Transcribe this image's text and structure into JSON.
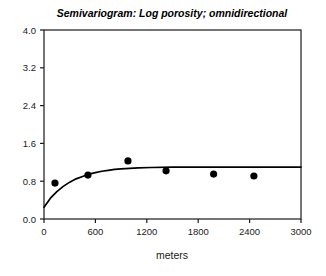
{
  "chart_data": {
    "type": "scatter",
    "title": "Semivariogram: Log porosity; omnidirectional",
    "xlabel": "meters",
    "ylabel": "",
    "xlim": [
      0,
      3000
    ],
    "ylim": [
      0.0,
      4.0
    ],
    "grid": false,
    "legend": "none",
    "xticks": [
      "0",
      "600",
      "1200",
      "1800",
      "2400",
      "3000"
    ],
    "xtick_values": [
      0,
      600,
      1200,
      1800,
      2400,
      3000
    ],
    "yticks": [
      "0.0",
      "0.8",
      "1.6",
      "2.4",
      "3.2",
      "4.0"
    ],
    "ytick_values": [
      0.0,
      0.8,
      1.6,
      2.4,
      3.2,
      4.0
    ],
    "series": [
      {
        "name": "experimental semivariogram",
        "kind": "scatter",
        "marker": "filled-circle",
        "color": "#000000",
        "points": [
          {
            "x": 128,
            "y": 0.76
          },
          {
            "x": 513,
            "y": 0.93
          },
          {
            "x": 980,
            "y": 1.23
          },
          {
            "x": 1425,
            "y": 1.02
          },
          {
            "x": 1980,
            "y": 0.95
          },
          {
            "x": 2450,
            "y": 0.91
          }
        ]
      },
      {
        "name": "fitted model",
        "kind": "line",
        "color": "#000000",
        "model": "exponential",
        "nugget": 0.25,
        "sill": 1.1,
        "range": 900,
        "points": [
          {
            "x": 0,
            "y": 0.25
          },
          {
            "x": 75,
            "y": 0.44
          },
          {
            "x": 150,
            "y": 0.58
          },
          {
            "x": 225,
            "y": 0.69
          },
          {
            "x": 300,
            "y": 0.78
          },
          {
            "x": 375,
            "y": 0.85
          },
          {
            "x": 450,
            "y": 0.9
          },
          {
            "x": 525,
            "y": 0.95
          },
          {
            "x": 600,
            "y": 0.98
          },
          {
            "x": 675,
            "y": 1.01
          },
          {
            "x": 750,
            "y": 1.03
          },
          {
            "x": 825,
            "y": 1.05
          },
          {
            "x": 900,
            "y": 1.06
          },
          {
            "x": 1000,
            "y": 1.07
          },
          {
            "x": 1100,
            "y": 1.08
          },
          {
            "x": 1250,
            "y": 1.09
          },
          {
            "x": 1500,
            "y": 1.1
          },
          {
            "x": 1800,
            "y": 1.1
          },
          {
            "x": 2100,
            "y": 1.1
          },
          {
            "x": 2400,
            "y": 1.1
          },
          {
            "x": 2700,
            "y": 1.1
          },
          {
            "x": 3000,
            "y": 1.1
          }
        ]
      }
    ],
    "colors": {
      "axis": "#1a1a1a",
      "marker": "#000000",
      "model_line": "#000000",
      "background": "#ffffff"
    }
  }
}
